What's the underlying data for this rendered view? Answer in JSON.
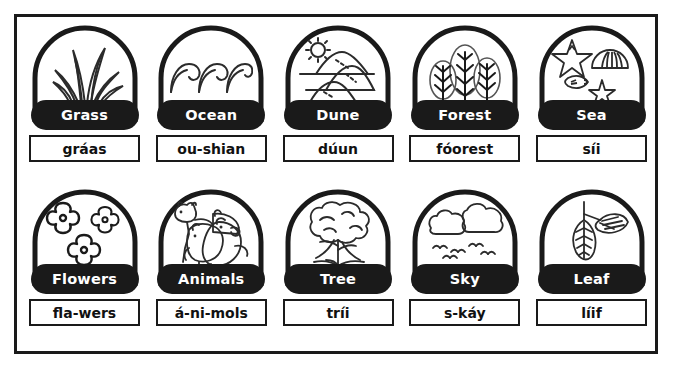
{
  "worksheet": {
    "title": "Nature Vocabulary Picture Cards",
    "border_color": "#1a1a1a",
    "pill_color": "#1a1a1a",
    "pill_text_color": "#ffffff",
    "background_color": "#ffffff",
    "rows": 2,
    "columns": 5
  },
  "cards": [
    {
      "id": "grass",
      "label": "Grass",
      "pronunciation": "gráas",
      "icon": "grass-icon",
      "row": 1,
      "column": 1
    },
    {
      "id": "ocean",
      "label": "Ocean",
      "pronunciation": "ou-shian",
      "icon": "ocean-waves-icon",
      "row": 1,
      "column": 2
    },
    {
      "id": "dune",
      "label": "Dune",
      "pronunciation": "dúun",
      "icon": "dune-sun-icon",
      "row": 1,
      "column": 3
    },
    {
      "id": "forest",
      "label": "Forest",
      "pronunciation": "fóorest",
      "icon": "forest-trees-icon",
      "row": 1,
      "column": 4
    },
    {
      "id": "sea",
      "label": "Sea",
      "pronunciation": "síi",
      "icon": "seashells-starfish-icon",
      "row": 1,
      "column": 5
    },
    {
      "id": "flowers",
      "label": "Flowers",
      "pronunciation": "fla-wers",
      "icon": "flowers-icon",
      "row": 2,
      "column": 1
    },
    {
      "id": "animals",
      "label": "Animals",
      "pronunciation": "á-ni-mols",
      "icon": "farm-animals-icon",
      "row": 2,
      "column": 2
    },
    {
      "id": "tree",
      "label": "Tree",
      "pronunciation": "tríi",
      "icon": "tree-icon",
      "row": 2,
      "column": 3
    },
    {
      "id": "sky",
      "label": "Sky",
      "pronunciation": "s-káy",
      "icon": "clouds-birds-icon",
      "row": 2,
      "column": 4
    },
    {
      "id": "leaf",
      "label": "Leaf",
      "pronunciation": "líif",
      "icon": "leaf-icon",
      "row": 2,
      "column": 5
    }
  ]
}
